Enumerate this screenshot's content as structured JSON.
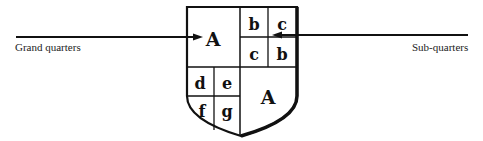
{
  "labels": {
    "left": "Grand quarters",
    "right": "Sub-quarters"
  },
  "shield": {
    "grand_quarter_1": "A",
    "grand_quarter_4": "A",
    "sub_quarters_2": [
      "b",
      "c",
      "c",
      "b"
    ],
    "sub_quarters_3": [
      "d",
      "e",
      "f",
      "g"
    ]
  }
}
